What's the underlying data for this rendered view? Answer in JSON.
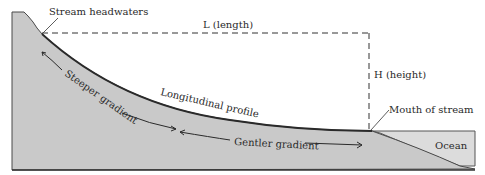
{
  "diagram": {
    "type": "stream longitudinal profile",
    "labels": {
      "headwaters": "Stream headwaters",
      "length": "L (length)",
      "height": "H (height)",
      "profile": "Longitudinal profile",
      "steeper": "Steeper gradient",
      "gentler": "Gentler gradient",
      "mouth": "Mouth of stream",
      "ocean": "Ocean"
    },
    "colors": {
      "land": "#c9c9c9",
      "ocean": "#dcdcdc",
      "outline": "#3a3a3a",
      "text": "#2a2a2a",
      "background": "#ffffff"
    }
  }
}
